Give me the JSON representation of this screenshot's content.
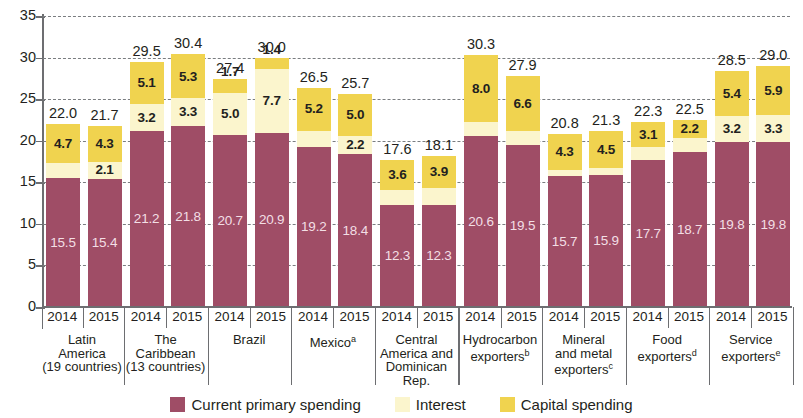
{
  "chart_data": {
    "type": "bar",
    "subtype": "stacked-bar",
    "title": "",
    "xlabel": "",
    "ylabel": "",
    "ylim": [
      0,
      35
    ],
    "ytick_step": 5,
    "yticks": [
      "0",
      "5",
      "10",
      "15",
      "20",
      "25",
      "30",
      "35"
    ],
    "grid": true,
    "grid_style": "dashed-horizontal",
    "legend_position": "bottom-center",
    "series": [
      {
        "name": "Current primary spending",
        "color": "#9f4d66",
        "values": [
          15.5,
          15.4,
          21.2,
          21.8,
          20.7,
          20.9,
          19.2,
          18.4,
          12.3,
          12.3,
          20.6,
          19.5,
          15.7,
          15.9,
          17.7,
          18.7,
          19.8,
          19.8
        ]
      },
      {
        "name": "Interest",
        "color": "#fbf5cd",
        "values": [
          1.8,
          2.1,
          3.2,
          3.3,
          5.0,
          7.7,
          2.0,
          2.2,
          1.8,
          2.0,
          1.7,
          1.7,
          0.8,
          0.8,
          1.5,
          1.6,
          3.2,
          3.3
        ]
      },
      {
        "name": "Capital spending",
        "color": "#f0d34f",
        "values": [
          4.7,
          4.3,
          5.1,
          5.3,
          1.7,
          1.4,
          5.2,
          5.0,
          3.6,
          3.9,
          8.0,
          6.6,
          4.3,
          4.5,
          3.1,
          2.2,
          5.4,
          5.9
        ]
      }
    ],
    "totals": [
      22.0,
      21.7,
      29.5,
      30.4,
      27.4,
      30.0,
      26.5,
      25.7,
      17.6,
      18.1,
      30.3,
      27.9,
      20.8,
      21.3,
      22.3,
      22.5,
      28.5,
      29.0
    ],
    "x": [
      "2014",
      "2015",
      "2014",
      "2015",
      "2014",
      "2015",
      "2014",
      "2015",
      "2014",
      "2015",
      "2014",
      "2015",
      "2014",
      "2015",
      "2014",
      "2015",
      "2014",
      "2015"
    ],
    "groups": [
      {
        "lines": [
          "Latin",
          "America",
          "(19 countries)"
        ],
        "sup": ""
      },
      {
        "lines": [
          "The",
          "Caribbean",
          "(13 countries)"
        ],
        "sup": ""
      },
      {
        "lines": [
          "Brazil"
        ],
        "sup": ""
      },
      {
        "lines": [
          "Mexico"
        ],
        "sup": "a"
      },
      {
        "lines": [
          "Central",
          "America and",
          "Dominican Rep."
        ],
        "sup": ""
      },
      {
        "lines": [
          "Hydrocarbon",
          "exporters"
        ],
        "sup": "b"
      },
      {
        "lines": [
          "Mineral",
          "and metal",
          "exporters"
        ],
        "sup": "c"
      },
      {
        "lines": [
          "Food",
          "exporters"
        ],
        "sup": "d"
      },
      {
        "lines": [
          "Service",
          "exporters"
        ],
        "sup": "e"
      }
    ],
    "legend": [
      {
        "label": "Current primary spending",
        "color": "#9f4d66"
      },
      {
        "label": "Interest",
        "color": "#fbf5cd"
      },
      {
        "label": "Capital spending",
        "color": "#f0d34f"
      }
    ]
  }
}
